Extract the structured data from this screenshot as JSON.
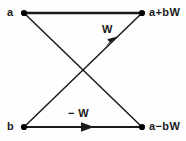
{
  "diagram": {
    "kind": "butterfly-signal-flow-graph",
    "background_color": "#fefefe",
    "line_color": "#1a1a1a",
    "node_color": "#000000",
    "text_color": "#1a1a1a",
    "nodes": [
      {
        "id": "in-top",
        "label": "a",
        "x": 24,
        "y": 13
      },
      {
        "id": "out-top",
        "label": "a+bW",
        "x": 142,
        "y": 13
      },
      {
        "id": "in-bot",
        "label": "b",
        "x": 24,
        "y": 127
      },
      {
        "id": "out-bot",
        "label": "a-bW",
        "x": 142,
        "y": 127
      }
    ],
    "edges": [
      {
        "id": "top-horizontal",
        "from": "in-top",
        "to": "out-top",
        "label": "",
        "arrow": false,
        "weight": "1"
      },
      {
        "id": "bottom-horizontal",
        "from": "in-bot",
        "to": "out-bot",
        "label": "-W",
        "arrow": true,
        "weight": "-W"
      },
      {
        "id": "diag-up",
        "from": "in-bot",
        "to": "out-top",
        "label": "W",
        "arrow": true,
        "weight": "W"
      },
      {
        "id": "diag-down",
        "from": "in-top",
        "to": "out-bot",
        "label": "",
        "arrow": false,
        "weight": "1"
      }
    ],
    "labels": {
      "input_top": "a",
      "input_bottom": "b",
      "output_top": "a+bW",
      "output_bottom": "a−bW",
      "weight_up": "W",
      "weight_bottom": "− W"
    }
  }
}
